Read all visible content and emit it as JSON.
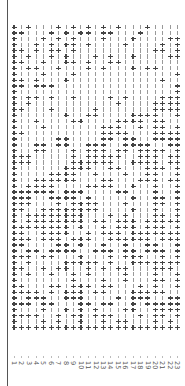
{
  "table": {
    "orientation": "rotated-90",
    "symbols": {
      "P": "+",
      "M": "−"
    },
    "column_labels": [
      "1",
      "2",
      "3",
      "4",
      "5",
      "6",
      "7",
      "8",
      "9",
      "10",
      "11",
      "12",
      "13",
      "14",
      "15",
      "16",
      "17",
      "18",
      "19",
      "20",
      "21",
      "22",
      "23"
    ],
    "rows": [
      "PMPMMMPMPMPMPMPMMMPMMMM",
      "PPMMMPMPMPPMPPMMMPMMMMM",
      "PMMMPMPMPMMMPMMMPMMMMPP",
      "PMMPMPMPPMPMMMMPMMMMPMP",
      "PPMPMPPMPMMMMMMMMMMPPMP",
      "PMPMMPMPMMMPMPMMPMMMMPP",
      "PPMMPMMPPMPMMPPMMMMMMMM",
      "PMPPMMPMMMPMPMMMPMPPMMM",
      "PMMMPMMMPMMMMMMMMMMMMMP",
      "PPMPMMMPMMMMMMMMMMMMPMM",
      "PPMPPPMMMMMMMMMMMMMMMMP",
      "PMMMMMMMMMMMMMMMMMMMMMP",
      "PMPPMPMMPMMMMPMPMMMMPPP",
      "PMPMMMMMMMMMMMPMMMMPPPP",
      "PPMMMPMMMMMPMMMMMMMPPPP",
      "PMMMMMMPMMPPMMMMPPPPMMP",
      "PMMPMMMMPPMMMMPPPPMPPMM",
      "PMMMPMMMMMMMPPPMMPMPPMP",
      "PPMMMMMMMMMMPPPPMMMPPPP",
      "PMMMMMPPMMMMPPMPPMMPPPP",
      "PMMPPMPPMMPPPMMPPPPMMPP",
      "PMMPPMMMPMPPPMPPMPPPPMP",
      "PPPMMMMMPMPPPPPMMPPPMPP",
      "PPPMMMMMPPPPPPMMPPPPMPP",
      "PMMMMMMPPPPMMPPMMMPPPMP",
      "PMMMMPPPPMMPMMMPMMPPMMP",
      "PMMPPPPPPMMMPPMMMPPPMPP",
      "PMPPPPMMMMPPPPMMPMMPMMP",
      "PPPPPPMPPPMMMMPPMMMPMMP",
      "PPPMMPPPPMPMMMMMPMMPPMP",
      "PPPMMMPMPPPPMMMPMMMPPMP",
      "PPMMPPPPPPPPMMMMPMMPMMP",
      "PMPPPPPPPPMMMPMPMMMPPMP",
      "PMPPPPPPPPMPPMPPPMPPPPP",
      "PPPPPPPPMPMMPMPPPMPPPMP",
      "PPMMPPPPMMPMPPPMPPPPPPP",
      "PPPMPPPMPPPMMPPPPPPMPPP",
      "PPMMMMPPMPMMPMMPMMPPMMP",
      "PMPPMPPPPMMPPPMPPMPPPMP",
      "PPPMPPMMMPMMMPMPPPMMPMP",
      "PMPMMMMPPPPPMPMMPPPPPPP",
      "PPMMPMPPMMPMPMPPMMMPPPM",
      "PMPMMPMMPMPMMMMPMMMPMMP",
      "PMMMMMMMPMMMPMMPMMMPPMP",
      "PPMMMPPMPPPMPPMMMPMPMMP",
      "PPPPMPMPPPMPPMMMPPPPPMM",
      "PMPPPMMPPPMMMMPMPPPMMPP",
      "PPPMPPMMMPPMPPMMPMPPPPP",
      "PMMMPMMPMPMPMMMPPMMPPPP",
      "PPPPMMPMPPMPPPMMMPMPPMP",
      "PMMMPMPMMPMMPMPPMMMPMPM",
      "PPPPPPPPPPPPPPPPPPPPPPP"
    ]
  }
}
